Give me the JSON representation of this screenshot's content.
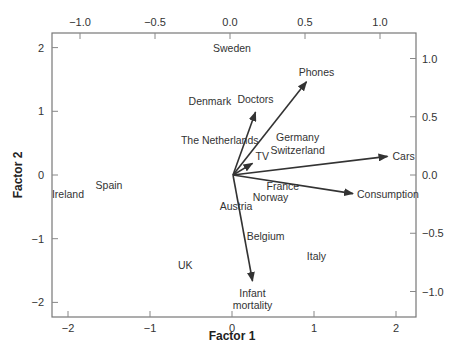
{
  "chart_data": {
    "type": "scatter",
    "subtype": "biplot",
    "title": "",
    "xlabel": "Factor 1",
    "ylabel": "Factor 2",
    "axes": {
      "bottom": {
        "ticks": [
          -2,
          -1,
          0,
          1,
          2
        ],
        "tick_labels": [
          "−2",
          "−1",
          "0",
          "1",
          "2"
        ],
        "range": [
          -2.2,
          2.2
        ]
      },
      "left": {
        "ticks": [
          2,
          1,
          0,
          -1,
          -2
        ],
        "tick_labels": [
          "2",
          "1",
          "0",
          "−1",
          "−2"
        ],
        "range": [
          -2.2,
          2.2
        ]
      },
      "top": {
        "ticks": [
          -1.0,
          -0.5,
          0.0,
          0.5,
          1.0
        ],
        "tick_labels": [
          "−1.0",
          "−0.5",
          "0.0",
          "0.5",
          "1.0"
        ],
        "range": [
          -1.2,
          1.25
        ]
      },
      "right": {
        "ticks": [
          1.0,
          0.5,
          0.0,
          -0.5,
          -1.0
        ],
        "tick_labels": [
          "1.0",
          "0.5",
          "0.0",
          "−0.5",
          "−1.0"
        ],
        "range": [
          -1.23,
          1.23
        ]
      }
    },
    "grid": false,
    "legend": null,
    "points": [
      {
        "label": "Sweden",
        "x": 0.0,
        "y": 2.0
      },
      {
        "label": "Denmark",
        "x": -0.27,
        "y": 1.16
      },
      {
        "label": "The Netherlands",
        "x": -0.15,
        "y": 0.55
      },
      {
        "label": "Germany",
        "x": 0.8,
        "y": 0.6
      },
      {
        "label": "Switzerland",
        "x": 0.8,
        "y": 0.4
      },
      {
        "label": "Ireland",
        "x": -2.0,
        "y": -0.3
      },
      {
        "label": "Spain",
        "x": -1.5,
        "y": -0.15
      },
      {
        "label": "France",
        "x": 0.62,
        "y": -0.18
      },
      {
        "label": "Norway",
        "x": 0.47,
        "y": -0.35
      },
      {
        "label": "Austria",
        "x": 0.05,
        "y": -0.48
      },
      {
        "label": "Belgium",
        "x": 0.41,
        "y": -0.95
      },
      {
        "label": "Italy",
        "x": 1.03,
        "y": -1.27
      },
      {
        "label": "UK",
        "x": -0.57,
        "y": -1.41
      }
    ],
    "vectors": [
      {
        "label": "Doctors",
        "x": 0.17,
        "y": 0.54
      },
      {
        "label": "Phones",
        "x": 0.51,
        "y": 0.8
      },
      {
        "label": "TV",
        "x": 0.15,
        "y": 0.1
      },
      {
        "label": "Cars",
        "x": 1.05,
        "y": 0.16
      },
      {
        "label": "Consumption",
        "x": 0.82,
        "y": -0.16
      },
      {
        "label": "Infant mortality",
        "x": 0.15,
        "y": -0.91
      }
    ]
  },
  "labels": {
    "xlabel": "Factor 1",
    "ylabel": "Factor 2",
    "infant_line1": "Infant",
    "infant_line2": "mortality"
  }
}
